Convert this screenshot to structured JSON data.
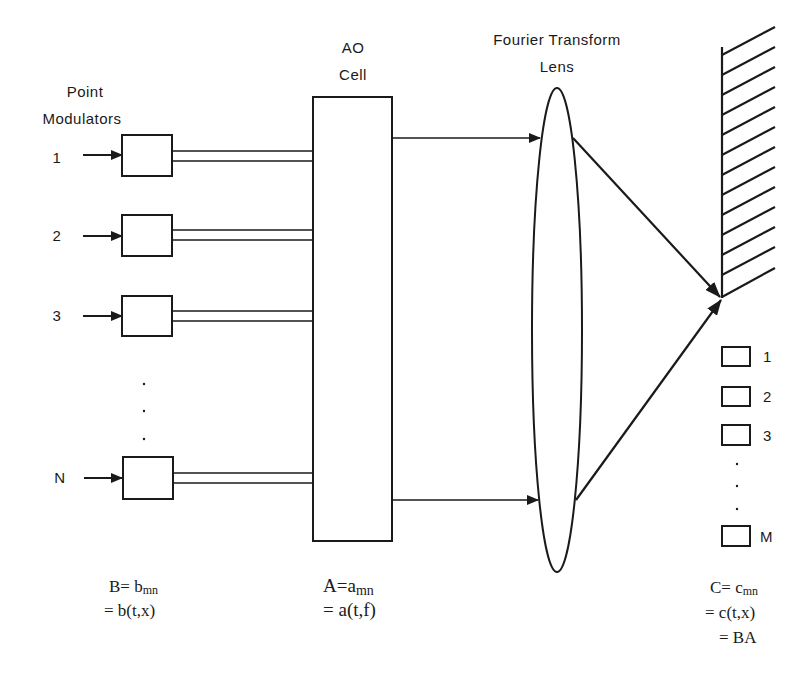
{
  "diagram": {
    "title_labels": {
      "point_modulators_line1": "Point",
      "point_modulators_line2": "Modulators",
      "ao_cell_line1": "AO",
      "ao_cell_line2": "Cell",
      "ft_lens_line1": "Fourier  Transform",
      "ft_lens_line2": "Lens"
    },
    "modulators": [
      {
        "index_label": "1"
      },
      {
        "index_label": "2"
      },
      {
        "index_label": "3"
      },
      {
        "index_label": "N"
      }
    ],
    "detectors": [
      {
        "index_label": "1"
      },
      {
        "index_label": "2"
      },
      {
        "index_label": "3"
      },
      {
        "index_label": "M"
      }
    ],
    "equations": {
      "B": {
        "line1_main": "B= b",
        "line1_sub": "mn",
        "line2": "=  b(t,x)"
      },
      "A": {
        "line1_main": "A=a",
        "line1_sub": "mn",
        "line2": "= a(t,f)"
      },
      "C": {
        "line1_main": "C= c",
        "line1_sub": "mn",
        "line2": "=  c(t,x)",
        "line3": "= BA"
      }
    },
    "colors": {
      "ink": "#1a1a1a",
      "background": "#ffffff"
    }
  }
}
